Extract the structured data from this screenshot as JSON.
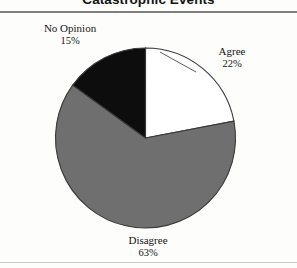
{
  "title": "Catastrophic Events",
  "chart_data": {
    "type": "pie",
    "title": "Catastrophic Events",
    "xlabel": "",
    "ylabel": "",
    "legend_position": "none",
    "grid": false,
    "labels": [
      "Agree",
      "Disagree",
      "No Opinion"
    ],
    "values": [
      22,
      63,
      15
    ],
    "value_suffix": "%",
    "start_angle_deg": 0,
    "direction": "clockwise",
    "slices": [
      {
        "label": "Agree",
        "value": 22,
        "percent_text": "22%",
        "color": "#ffffff",
        "start_deg": 0,
        "end_deg": 79.2
      },
      {
        "label": "Disagree",
        "value": 63,
        "percent_text": "63%",
        "color": "#6f6f6f",
        "start_deg": 79.2,
        "end_deg": 306.0
      },
      {
        "label": "No Opinion",
        "value": 15,
        "percent_text": "15%",
        "color": "#0d0d0d",
        "start_deg": 306.0,
        "end_deg": 360.0
      }
    ],
    "outline_color": "#3a3a3a",
    "background": "#fdfdfb"
  },
  "labels": {
    "agree": {
      "name": "Agree",
      "percent": "22%"
    },
    "disagree": {
      "name": "Disagree",
      "percent": "63%"
    },
    "no_opinion": {
      "name": "No Opinion",
      "percent": "15%"
    }
  },
  "colors": {
    "agree": "#ffffff",
    "disagree": "#6f6f6f",
    "no_opinion": "#0d0d0d",
    "outline": "#3a3a3a",
    "rule_top": "#7e7e7e",
    "rule_bottom": "#c9c9c9",
    "background": "#fdfdfb",
    "text": "#151515"
  }
}
